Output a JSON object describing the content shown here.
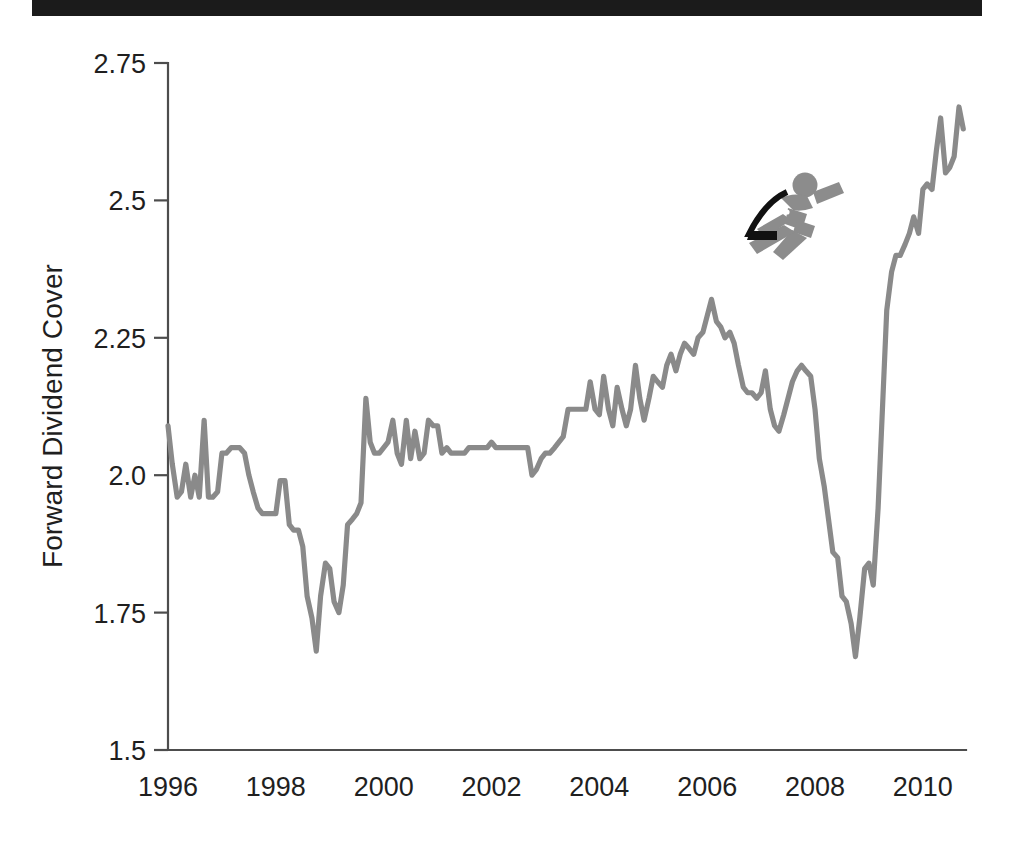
{
  "figure": {
    "scan_artifact": "black-bar",
    "background_color": "#ffffff",
    "logo": {
      "name": "running-figure-logo",
      "body_color": "#8c8c8c",
      "accent_color": "#111111"
    }
  },
  "axes": {
    "y_title": "Forward Dividend Cover",
    "y_ticks": [
      "1.5",
      "1.75",
      "2.0",
      "2.25",
      "2.5",
      "2.75"
    ],
    "x_ticks": [
      "1996",
      "1998",
      "2000",
      "2002",
      "2004",
      "2006",
      "2008",
      "2010"
    ],
    "axis_color": "#4d4d4d"
  },
  "chart_data": {
    "type": "line",
    "title": "",
    "subtitle": "",
    "xlabel": "",
    "ylabel": "Forward Dividend Cover",
    "xlim": [
      1996.0,
      2010.8
    ],
    "ylim": [
      1.5,
      2.75
    ],
    "yticks": [
      1.5,
      1.75,
      2.0,
      2.25,
      2.5,
      2.75
    ],
    "ytick_labels": [
      "1.5",
      "1.75",
      "2.0",
      "2.25",
      "2.5",
      "2.75"
    ],
    "xticks": [
      1996,
      1998,
      2000,
      2002,
      2004,
      2006,
      2008,
      2010
    ],
    "xtick_labels": [
      "1996",
      "1998",
      "2000",
      "2002",
      "2004",
      "2006",
      "2008",
      "2010"
    ],
    "grid": false,
    "legend": null,
    "series": [
      {
        "name": "Forward Dividend Cover",
        "color": "#8a8a8a",
        "line_width": 5.2,
        "x": [
          1996.0,
          1996.08,
          1996.17,
          1996.25,
          1996.33,
          1996.42,
          1996.5,
          1996.58,
          1996.67,
          1996.75,
          1996.83,
          1996.92,
          1997.0,
          1997.08,
          1997.17,
          1997.25,
          1997.33,
          1997.42,
          1997.5,
          1997.58,
          1997.67,
          1997.75,
          1997.83,
          1997.92,
          1998.0,
          1998.08,
          1998.17,
          1998.25,
          1998.33,
          1998.42,
          1998.5,
          1998.58,
          1998.67,
          1998.75,
          1998.83,
          1998.92,
          1999.0,
          1999.08,
          1999.17,
          1999.25,
          1999.33,
          1999.42,
          1999.5,
          1999.58,
          1999.67,
          1999.75,
          1999.83,
          1999.92,
          2000.0,
          2000.08,
          2000.17,
          2000.25,
          2000.33,
          2000.42,
          2000.5,
          2000.58,
          2000.67,
          2000.75,
          2000.83,
          2000.92,
          2001.0,
          2001.08,
          2001.17,
          2001.25,
          2001.33,
          2001.42,
          2001.5,
          2001.58,
          2001.67,
          2001.75,
          2001.83,
          2001.92,
          2002.0,
          2002.08,
          2002.17,
          2002.25,
          2002.33,
          2002.42,
          2002.5,
          2002.58,
          2002.67,
          2002.75,
          2002.83,
          2002.92,
          2003.0,
          2003.08,
          2003.17,
          2003.25,
          2003.33,
          2003.42,
          2003.5,
          2003.58,
          2003.67,
          2003.75,
          2003.83,
          2003.92,
          2004.0,
          2004.08,
          2004.17,
          2004.25,
          2004.33,
          2004.42,
          2004.5,
          2004.58,
          2004.67,
          2004.75,
          2004.83,
          2004.92,
          2005.0,
          2005.08,
          2005.17,
          2005.25,
          2005.33,
          2005.42,
          2005.5,
          2005.58,
          2005.67,
          2005.75,
          2005.83,
          2005.92,
          2006.0,
          2006.08,
          2006.17,
          2006.25,
          2006.33,
          2006.42,
          2006.5,
          2006.58,
          2006.67,
          2006.75,
          2006.83,
          2006.92,
          2007.0,
          2007.08,
          2007.17,
          2007.25,
          2007.33,
          2007.42,
          2007.5,
          2007.58,
          2007.67,
          2007.75,
          2007.83,
          2007.92,
          2008.0,
          2008.08,
          2008.17,
          2008.25,
          2008.33,
          2008.42,
          2008.5,
          2008.58,
          2008.67,
          2008.75,
          2008.83,
          2008.92,
          2009.0,
          2009.08,
          2009.17,
          2009.25,
          2009.33,
          2009.42,
          2009.5,
          2009.58,
          2009.67,
          2009.75,
          2009.83,
          2009.92,
          2010.0,
          2010.08,
          2010.17,
          2010.25,
          2010.33,
          2010.42,
          2010.5,
          2010.58,
          2010.67,
          2010.75
        ],
        "y": [
          2.09,
          2.02,
          1.96,
          1.97,
          2.02,
          1.96,
          2.0,
          1.96,
          2.1,
          1.96,
          1.96,
          1.97,
          2.04,
          2.04,
          2.05,
          2.05,
          2.05,
          2.04,
          2.0,
          1.97,
          1.94,
          1.93,
          1.93,
          1.93,
          1.93,
          1.99,
          1.99,
          1.91,
          1.9,
          1.9,
          1.87,
          1.78,
          1.74,
          1.68,
          1.78,
          1.84,
          1.83,
          1.77,
          1.75,
          1.8,
          1.91,
          1.92,
          1.93,
          1.95,
          2.14,
          2.06,
          2.04,
          2.04,
          2.05,
          2.06,
          2.1,
          2.04,
          2.02,
          2.1,
          2.03,
          2.08,
          2.03,
          2.04,
          2.1,
          2.09,
          2.09,
          2.04,
          2.05,
          2.04,
          2.04,
          2.04,
          2.04,
          2.05,
          2.05,
          2.05,
          2.05,
          2.05,
          2.06,
          2.05,
          2.05,
          2.05,
          2.05,
          2.05,
          2.05,
          2.05,
          2.05,
          2.0,
          2.01,
          2.03,
          2.04,
          2.04,
          2.05,
          2.06,
          2.07,
          2.12,
          2.12,
          2.12,
          2.12,
          2.12,
          2.17,
          2.12,
          2.11,
          2.18,
          2.12,
          2.09,
          2.16,
          2.12,
          2.09,
          2.12,
          2.2,
          2.14,
          2.1,
          2.14,
          2.18,
          2.17,
          2.16,
          2.2,
          2.22,
          2.19,
          2.22,
          2.24,
          2.23,
          2.22,
          2.25,
          2.26,
          2.29,
          2.32,
          2.28,
          2.27,
          2.25,
          2.26,
          2.24,
          2.2,
          2.16,
          2.15,
          2.15,
          2.14,
          2.15,
          2.19,
          2.12,
          2.09,
          2.08,
          2.11,
          2.14,
          2.17,
          2.19,
          2.2,
          2.19,
          2.18,
          2.12,
          2.03,
          1.98,
          1.92,
          1.86,
          1.85,
          1.78,
          1.77,
          1.73,
          1.67,
          1.74,
          1.83,
          1.84,
          1.8,
          1.94,
          2.12,
          2.3,
          2.37,
          2.4,
          2.4,
          2.42,
          2.44,
          2.47,
          2.44,
          2.52,
          2.53,
          2.52,
          2.59,
          2.65,
          2.55,
          2.56,
          2.58,
          2.67,
          2.63
        ]
      }
    ]
  }
}
